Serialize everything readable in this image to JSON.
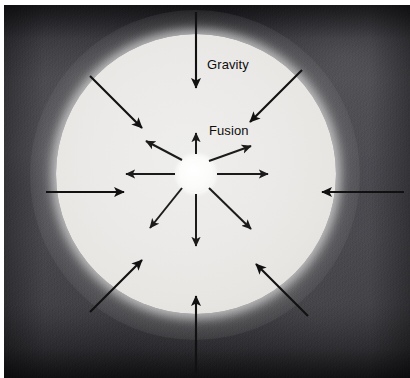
{
  "figure": {
    "width": 410,
    "height": 378
  },
  "labels": {
    "gravity": "Gravity",
    "fusion": "Fusion"
  },
  "colors": {
    "arrow": "#111111",
    "star_body": "#eceae8",
    "core": "#ffffff",
    "space": "#3b3b42",
    "label_text": "#0d0d0d"
  },
  "diagram": {
    "center": {
      "x": 196,
      "y": 174
    },
    "star_radius": 140,
    "core_radius": 18,
    "forces": [
      {
        "name": "gravity",
        "label": "Gravity",
        "direction": "inward",
        "arrow_count": 8,
        "description": "Arrows point inward toward the stellar core"
      },
      {
        "name": "fusion",
        "label": "Fusion",
        "direction": "outward",
        "arrow_count": 8,
        "description": "Arrows radiate outward from the fusing core"
      }
    ],
    "gravity_arrows": [
      {
        "id": "g-n",
        "angle_deg": 270,
        "from": {
          "x": 196,
          "y": 12
        },
        "to": {
          "x": 196,
          "y": 88
        }
      },
      {
        "id": "g-ne",
        "angle_deg": 315,
        "from": {
          "x": 302,
          "y": 70
        },
        "to": {
          "x": 248,
          "y": 124
        }
      },
      {
        "id": "g-e",
        "angle_deg": 0,
        "from": {
          "x": 404,
          "y": 192
        },
        "to": {
          "x": 320,
          "y": 192
        }
      },
      {
        "id": "g-se",
        "angle_deg": 45,
        "from": {
          "x": 308,
          "y": 316
        },
        "to": {
          "x": 254,
          "y": 262
        }
      },
      {
        "id": "g-s",
        "angle_deg": 90,
        "from": {
          "x": 196,
          "y": 374
        },
        "to": {
          "x": 196,
          "y": 296
        }
      },
      {
        "id": "g-sw",
        "angle_deg": 135,
        "from": {
          "x": 90,
          "y": 312
        },
        "to": {
          "x": 144,
          "y": 258
        }
      },
      {
        "id": "g-w",
        "angle_deg": 180,
        "from": {
          "x": 46,
          "y": 192
        },
        "to": {
          "x": 126,
          "y": 192
        }
      },
      {
        "id": "g-nw",
        "angle_deg": 225,
        "from": {
          "x": 90,
          "y": 76
        },
        "to": {
          "x": 144,
          "y": 130
        }
      }
    ],
    "fusion_arrows": [
      {
        "id": "f-n",
        "angle_deg": 270,
        "from": {
          "x": 196,
          "y": 154
        },
        "to": {
          "x": 196,
          "y": 134
        }
      },
      {
        "id": "f-ne",
        "angle_deg": 315,
        "from": {
          "x": 210,
          "y": 160
        },
        "to": {
          "x": 250,
          "y": 147
        }
      },
      {
        "id": "f-e",
        "angle_deg": 0,
        "from": {
          "x": 216,
          "y": 174
        },
        "to": {
          "x": 266,
          "y": 174
        }
      },
      {
        "id": "f-se",
        "angle_deg": 45,
        "from": {
          "x": 210,
          "y": 188
        },
        "to": {
          "x": 250,
          "y": 228
        }
      },
      {
        "id": "f-s",
        "angle_deg": 90,
        "from": {
          "x": 196,
          "y": 194
        },
        "to": {
          "x": 196,
          "y": 244
        }
      },
      {
        "id": "f-sw",
        "angle_deg": 135,
        "from": {
          "x": 182,
          "y": 188
        },
        "to": {
          "x": 152,
          "y": 226
        }
      },
      {
        "id": "f-w",
        "angle_deg": 180,
        "from": {
          "x": 176,
          "y": 174
        },
        "to": {
          "x": 128,
          "y": 174
        }
      },
      {
        "id": "f-nw",
        "angle_deg": 225,
        "from": {
          "x": 182,
          "y": 160
        },
        "to": {
          "x": 148,
          "y": 142
        }
      }
    ]
  }
}
